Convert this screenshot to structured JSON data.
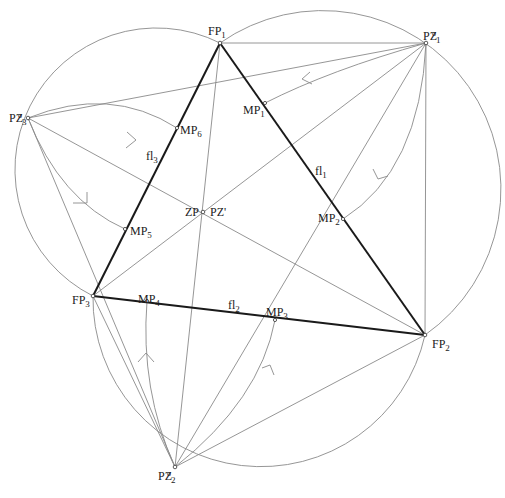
{
  "diagram": {
    "type": "geometric-construction",
    "colors": {
      "thick_line": "#1a1a1a",
      "thin_line": "#8a8a8a",
      "background": "#ffffff"
    },
    "vertices": {
      "FP1": {
        "x": 220,
        "y": 43
      },
      "FP2": {
        "x": 425,
        "y": 335
      },
      "FP3": {
        "x": 93,
        "y": 296
      }
    },
    "outer_points": {
      "PZ1": {
        "x": 426,
        "y": 43
      },
      "PZ2": {
        "x": 175,
        "y": 467
      },
      "PZ3": {
        "x": 28,
        "y": 118
      }
    },
    "center": {
      "x": 203,
      "y": 212
    },
    "midpoints": {
      "MP1": {
        "x": 265,
        "y": 103
      },
      "MP2": {
        "x": 343,
        "y": 219
      },
      "MP3": {
        "x": 275,
        "y": 320
      },
      "MP4": {
        "x": 147,
        "y": 301
      },
      "MP5": {
        "x": 125,
        "y": 229
      },
      "MP6": {
        "x": 177,
        "y": 128
      }
    },
    "labels": {
      "FP1": {
        "base": "FP",
        "sub": "1"
      },
      "FP2": {
        "base": "FP",
        "sub": "2"
      },
      "FP3": {
        "base": "FP",
        "sub": "3"
      },
      "PZ1": {
        "base": "PZ",
        "sup": "o",
        "sub": "1"
      },
      "PZ2": {
        "base": "PZ",
        "sup": "o",
        "sub": "2"
      },
      "PZ3": {
        "base": "PZ",
        "sup": "o",
        "sub": "3"
      },
      "ZP": "ZP",
      "PZprime": "PZ'",
      "MP1": {
        "base": "MP",
        "sub": "1"
      },
      "MP2": {
        "base": "MP",
        "sub": "2"
      },
      "MP3": {
        "base": "MP",
        "sub": "3"
      },
      "MP4": {
        "base": "MP",
        "sub": "4"
      },
      "MP5": {
        "base": "MP",
        "sub": "5"
      },
      "MP6": {
        "base": "MP",
        "sub": "6"
      },
      "fl1": {
        "base": "fl",
        "sub": "1"
      },
      "fl2": {
        "base": "fl",
        "sub": "2"
      },
      "fl3": {
        "base": "fl",
        "sub": "3"
      }
    }
  }
}
